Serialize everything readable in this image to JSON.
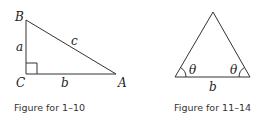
{
  "figures": [
    {
      "caption": "Figure for 1–10",
      "labels": {
        "vertex_b": "B",
        "vertex_c": "C",
        "vertex_a": "A",
        "side_a": "a",
        "side_b": "b",
        "side_c": "c"
      }
    },
    {
      "caption": "Figure for 11–14",
      "labels": {
        "angle_left": "θ",
        "angle_right": "θ",
        "base": "b"
      }
    }
  ]
}
